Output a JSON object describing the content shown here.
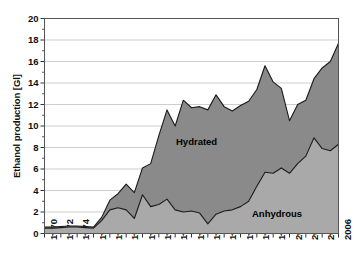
{
  "chart_data": {
    "type": "area",
    "stacked": true,
    "title": "",
    "xlabel": "",
    "ylabel": "Ethanol production [Gl]",
    "ylim": [
      0,
      20
    ],
    "xlim": [
      1970,
      2006
    ],
    "ytick_step": 2,
    "yminor_step": 1,
    "xtick_step": 2,
    "grid": "horizontal",
    "legend_position": "inline-annotation",
    "x": [
      1970,
      1971,
      1972,
      1973,
      1974,
      1975,
      1976,
      1977,
      1978,
      1979,
      1980,
      1981,
      1982,
      1983,
      1984,
      1985,
      1986,
      1987,
      1988,
      1989,
      1990,
      1991,
      1992,
      1993,
      1994,
      1995,
      1996,
      1997,
      1998,
      1999,
      2000,
      2001,
      2002,
      2003,
      2004,
      2005,
      2006
    ],
    "ytick_labels": [
      "0",
      "2",
      "4",
      "6",
      "8",
      "10",
      "12",
      "14",
      "16",
      "18",
      "20"
    ],
    "xtick_labels": [
      "1970",
      "1972",
      "1974",
      "1976",
      "1978",
      "1980",
      "1982",
      "1984",
      "1986",
      "1988",
      "1990",
      "1992",
      "1994",
      "1996",
      "1998",
      "2000",
      "2002",
      "2004",
      "2006"
    ],
    "series": [
      {
        "name": "Anhydrous",
        "color": "#a9a9a9",
        "line_color": "#1a1a1a",
        "values": [
          0.5,
          0.5,
          0.55,
          0.6,
          0.6,
          0.55,
          0.5,
          1.2,
          2.2,
          2.4,
          2.2,
          1.4,
          3.6,
          2.5,
          2.7,
          3.2,
          2.2,
          2.0,
          2.1,
          1.9,
          0.9,
          1.8,
          2.1,
          2.2,
          2.5,
          3.0,
          4.4,
          5.7,
          5.6,
          6.1,
          5.6,
          6.5,
          7.2,
          8.9,
          7.9,
          7.7,
          8.3
        ]
      },
      {
        "name": "Hydrated",
        "color": "#8a8a8a",
        "line_color": "#1a1a1a",
        "values": [
          0.1,
          0.1,
          0.1,
          0.1,
          0.1,
          0.1,
          0.1,
          0.3,
          0.9,
          1.3,
          2.4,
          2.4,
          2.5,
          4.0,
          6.4,
          8.3,
          7.8,
          10.4,
          9.6,
          9.9,
          10.6,
          11.1,
          9.7,
          9.2,
          9.4,
          9.3,
          9.0,
          9.9,
          8.5,
          7.4,
          4.9,
          5.5,
          5.2,
          5.5,
          7.5,
          8.3,
          9.4
        ]
      }
    ],
    "series_totals": [
      0.6,
      0.6,
      0.65,
      0.7,
      0.7,
      0.65,
      0.6,
      1.5,
      3.1,
      3.7,
      4.6,
      3.8,
      6.1,
      6.5,
      9.1,
      11.5,
      10.0,
      12.4,
      11.7,
      11.8,
      11.5,
      12.9,
      11.8,
      11.4,
      11.9,
      12.3,
      13.4,
      15.6,
      14.1,
      13.5,
      10.5,
      12.0,
      12.4,
      14.4,
      15.4,
      16.0,
      17.7
    ],
    "annotations": [
      {
        "label": "Hydrated",
        "x_px": 176,
        "y_px": 136
      },
      {
        "label": "Anhydrous",
        "x_px": 252,
        "y_px": 208
      }
    ]
  },
  "axis": {
    "y_title": "Ethanol production [Gl]"
  }
}
